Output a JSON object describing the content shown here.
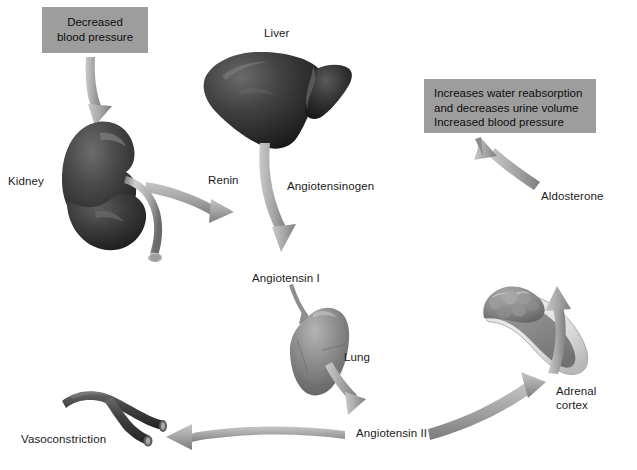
{
  "figure": {
    "background_color": "#ffffff",
    "callout_fill": "#9d9d9d",
    "arrow_fill": "#a6a6a6",
    "text_color": "#1a1a1a"
  },
  "callouts": [
    {
      "id": "decreased-blood-pressure",
      "text": "Decreased\nblood pressure",
      "x": 42,
      "y": 7,
      "width": 106,
      "height": 46
    },
    {
      "id": "increases-water-reabsorption",
      "text": "Increases water reabsorption\nand decreases urine volume\nIncreased blood pressure",
      "x": 424,
      "y": 79,
      "width": 172,
      "height": 54
    }
  ],
  "labels": [
    {
      "id": "kidney",
      "text": "Kidney",
      "x": 8,
      "y": 175
    },
    {
      "id": "liver",
      "text": "Liver",
      "x": 264,
      "y": 27
    },
    {
      "id": "renin",
      "text": "Renin",
      "x": 208,
      "y": 174
    },
    {
      "id": "angiotensinogen",
      "text": "Angiotensinogen",
      "x": 287,
      "y": 180
    },
    {
      "id": "angiotensin-i",
      "text": "Angiotensin I",
      "x": 252,
      "y": 272
    },
    {
      "id": "lung",
      "text": "Lung",
      "x": 344,
      "y": 351
    },
    {
      "id": "angiotensin-ii",
      "text": "Angiotensin II",
      "x": 356,
      "y": 427
    },
    {
      "id": "vasoconstriction",
      "text": "Vasoconstriction",
      "x": 21,
      "y": 433
    },
    {
      "id": "adrenal-cortex",
      "text": "Adrenal\ncortex",
      "x": 556,
      "y": 384
    },
    {
      "id": "aldosterone",
      "text": "Aldosterone",
      "x": 541,
      "y": 190
    }
  ],
  "organs": [
    {
      "id": "kidney",
      "name": "kidney-illustration",
      "description": "Dark bean-shaped kidney with light ureter"
    },
    {
      "id": "liver",
      "name": "liver-illustration",
      "description": "Dark two-lobed liver"
    },
    {
      "id": "lung",
      "name": "lung-illustration",
      "description": "Mid-gray single lung"
    },
    {
      "id": "adrenal",
      "name": "adrenal-gland-illustration",
      "description": "Crescent adrenal gland with lumpy cortex and pale medulla band"
    },
    {
      "id": "vessel",
      "name": "blood-vessel-illustration",
      "description": "Dark branching constricted blood vessel"
    }
  ],
  "arrows": [
    {
      "id": "bp-to-kidney",
      "from": "decreased-blood-pressure",
      "to": "kidney"
    },
    {
      "id": "kidney-to-renin",
      "from": "kidney",
      "to": "renin"
    },
    {
      "id": "liver-to-angiotensin-i",
      "from": "liver",
      "to": "angiotensin-i"
    },
    {
      "id": "angiotensin-i-to-lung",
      "from": "angiotensin-i",
      "to": "lung"
    },
    {
      "id": "lung-to-angiotensin-ii",
      "from": "lung",
      "to": "angiotensin-ii"
    },
    {
      "id": "angiotensin-ii-to-vasoconstriction",
      "from": "angiotensin-ii",
      "to": "vasoconstriction"
    },
    {
      "id": "angiotensin-ii-to-adrenal",
      "from": "angiotensin-ii",
      "to": "adrenal-cortex"
    },
    {
      "id": "adrenal-to-aldosterone",
      "from": "adrenal-cortex",
      "to": "aldosterone"
    },
    {
      "id": "aldosterone-to-effects",
      "from": "aldosterone",
      "to": "increases-water-reabsorption"
    }
  ]
}
